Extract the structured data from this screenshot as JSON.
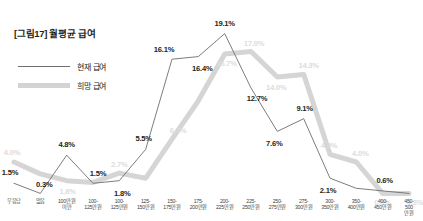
{
  "figure": {
    "title": "[그림17] 월평균 급여"
  },
  "legend": {
    "position": "top-left",
    "items": [
      {
        "key": "current",
        "label": "현재 급여",
        "style": "thin-dark-line",
        "color": "#6d6e71"
      },
      {
        "key": "desired",
        "label": "희망 급여",
        "style": "thick-gray-line",
        "color": "#d3d3d3"
      }
    ]
  },
  "chart_data": {
    "type": "line",
    "title": "[그림17] 월평균 급여",
    "xlabel": "",
    "ylabel": "",
    "ylim": [
      0,
      20
    ],
    "grid": false,
    "legend_position": "top-left",
    "categories": [
      "무응답",
      "없음",
      "100만원\n미만",
      "100-\n125만원",
      "100-\n125만원",
      "125-\n150만원",
      "150-\n175만원",
      "175-\n200만원",
      "200-\n225만원",
      "225-\n250만원",
      "250-\n275만원",
      "275-\n300만원",
      "300-\n350만원",
      "350-\n400만원",
      "400-\n450만원",
      "450-\n500만원"
    ],
    "series": [
      {
        "name": "현재 급여",
        "color": "#6d6e71",
        "values": [
          1.5,
          0.3,
          4.8,
          1.5,
          1.8,
          5.5,
          16.1,
          16.4,
          19.1,
          12.7,
          7.6,
          9.1,
          2.1,
          0.9,
          0.6,
          0.3
        ],
        "labels": [
          "1.5%",
          "0.3%",
          "4.8%",
          "1.5%",
          "1.8%",
          "5.5%",
          "16.1%",
          "16.4%",
          "19.1%",
          "12.7%",
          "7.6%",
          "9.1%",
          "2.1%",
          "",
          "0.6%",
          ""
        ]
      },
      {
        "name": "희망 급여",
        "color": "#d3d3d3",
        "values": [
          4.0,
          2.6,
          1.8,
          1.6,
          2.7,
          2.1,
          6.7,
          11.2,
          16.7,
          17.0,
          14.0,
          14.3,
          4.9,
          4.0,
          0.3,
          0.3
        ],
        "labels": [
          "4.0%",
          "",
          "1.8%",
          "",
          "2.7%",
          "",
          "6.7%",
          "",
          "16.7%",
          "17.0%",
          "14.0%",
          "14.3%",
          "4.9%",
          "4.0%",
          "0.3%",
          "0.3%"
        ]
      }
    ]
  }
}
